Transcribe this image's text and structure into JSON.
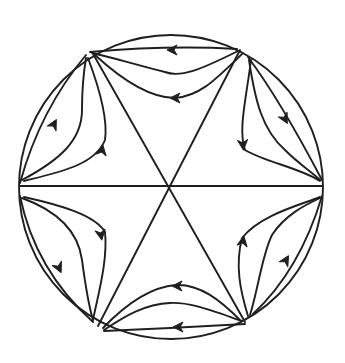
{
  "figure": {
    "title": "",
    "colors": {
      "ink": "#1f1f1f",
      "background": "#ffffff"
    },
    "circle": {
      "cx": 171,
      "cy": 187,
      "r": 152
    },
    "center": [
      171,
      187
    ],
    "diameters": [
      {
        "from": [
          20,
          186
        ],
        "to": [
          322,
          186
        ]
      },
      {
        "from": [
          92,
          52
        ],
        "to": [
          245,
          322
        ]
      },
      {
        "from": [
          240,
          50
        ],
        "to": [
          98,
          326
        ]
      }
    ],
    "sectors": [
      {
        "name": "top",
        "flow": "right-to-left",
        "curves": [
          {
            "d": "M237,49 Q170,45 90,52",
            "arrow": {
              "x": 172,
              "y": 50,
              "angle": 180
            }
          },
          {
            "d": "M238,51 C200,70 180,78 165,72 C140,66 115,58 92,53",
            "arrow": null
          },
          {
            "d": "M242,54 C215,80 200,96 175,98 C150,98 120,78 95,55",
            "arrow": {
              "x": 175,
              "y": 98,
              "angle": 180
            }
          }
        ]
      },
      {
        "name": "top-left",
        "flow": "upward",
        "curves": [
          {
            "d": "M20,183 Q40,110 86,55",
            "arrow": {
              "x": 54,
              "y": 124,
              "angle": -62
            }
          },
          {
            "d": "M22,180 C60,160 82,140 82,110 C82,90 84,70 86,58",
            "arrow": null
          },
          {
            "d": "M24,181 C60,172 95,165 105,140 C108,120 100,90 88,58",
            "arrow": {
              "x": 102,
              "y": 150,
              "angle": -80
            }
          }
        ]
      },
      {
        "name": "top-right",
        "flow": "downward",
        "curves": [
          {
            "d": "M248,57 Q280,100 322,180",
            "arrow": {
              "x": 285,
              "y": 119,
              "angle": 62
            }
          },
          {
            "d": "M249,60 C255,100 262,130 285,150 C300,165 312,172 320,180",
            "arrow": null
          },
          {
            "d": "M251,60 C246,100 238,130 245,150 C265,162 300,168 320,181",
            "arrow": {
              "x": 243,
              "y": 145,
              "angle": 85
            }
          }
        ]
      },
      {
        "name": "bottom-left",
        "flow": "downward",
        "curves": [
          {
            "d": "M20,196 Q35,270 93,322",
            "arrow": {
              "x": 59,
              "y": 268,
              "angle": 65
            }
          },
          {
            "d": "M22,198 C55,210 78,230 82,260 C86,290 90,310 93,320",
            "arrow": null
          },
          {
            "d": "M24,197 C60,205 95,215 105,232 C108,260 98,295 93,320",
            "arrow": {
              "x": 101,
              "y": 235,
              "angle": 80
            }
          }
        ]
      },
      {
        "name": "bottom-right",
        "flow": "upward",
        "curves": [
          {
            "d": "M253,314 Q300,270 322,196",
            "arrow": {
              "x": 286,
              "y": 260,
              "angle": -60
            }
          },
          {
            "d": "M250,315 C258,290 262,255 272,235 C285,215 305,205 320,198",
            "arrow": null
          },
          {
            "d": "M248,316 C240,290 235,265 242,238 C260,215 300,205 320,197",
            "arrow": {
              "x": 243,
              "y": 241,
              "angle": -80
            }
          }
        ]
      },
      {
        "name": "bottom",
        "flow": "right-to-left",
        "curves": [
          {
            "d": "M245,324 Q175,328 104,331",
            "arrow": {
              "x": 178,
              "y": 327,
              "angle": 180
            }
          },
          {
            "d": "M242,321 C210,310 190,302 170,303 C145,304 125,316 104,330",
            "arrow": null
          },
          {
            "d": "M240,320 C220,300 200,284 176,285 C150,287 125,305 103,328",
            "arrow": {
              "x": 177,
              "y": 286,
              "angle": 180
            }
          }
        ]
      }
    ]
  }
}
